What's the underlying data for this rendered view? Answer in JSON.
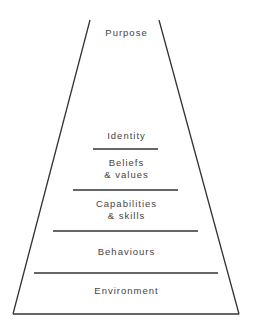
{
  "diagram": {
    "type": "logical-levels-pyramid",
    "top": {
      "label": "Purpose"
    },
    "levels": [
      {
        "label": "Identity"
      },
      {
        "label": "Beliefs\n& values",
        "line1": "Beliefs",
        "line2": "& values"
      },
      {
        "label": "Capabilities\n& skills",
        "line1": "Capabilities",
        "line2": "& skills"
      },
      {
        "label": "Behaviours"
      },
      {
        "label": "Environment"
      }
    ],
    "line_color": "#333333",
    "text_color": "#444444"
  }
}
